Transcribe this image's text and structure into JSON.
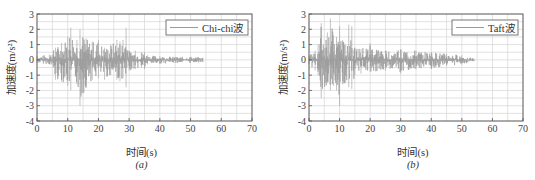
{
  "chart_data": [
    {
      "type": "line",
      "panel": "a",
      "caption": "(a)",
      "title": "",
      "xlabel": "时间(s)",
      "ylabel": "加速度(m/s²)",
      "xlim": [
        0,
        70
      ],
      "ylim": [
        -4,
        3
      ],
      "xticks": [
        0,
        10,
        20,
        30,
        40,
        50,
        60,
        70
      ],
      "yticks": [
        3,
        2,
        1,
        0,
        -1,
        -2,
        -3,
        -4
      ],
      "grid": true,
      "legend": {
        "position": "upper right",
        "entries": [
          "Chi-chi波"
        ]
      },
      "series": [
        {
          "name": "Chi-chi波",
          "color": "#9a9a9a",
          "duration_s": 54,
          "envelope": {
            "t": [
              0,
              4,
              6,
              8,
              10,
              11,
              13,
              14,
              16,
              18,
              20,
              22,
              24,
              26,
              27,
              28,
              29,
              30,
              32,
              34,
              35,
              36,
              40,
              45,
              50,
              54
            ],
            "upper": [
              0.25,
              0.35,
              0.8,
              1.1,
              1.5,
              2.1,
              1.3,
              2.0,
              1.4,
              1.2,
              1.3,
              0.8,
              1.0,
              1.3,
              1.2,
              1.3,
              2.1,
              0.6,
              0.6,
              0.5,
              0.5,
              0.3,
              0.25,
              0.2,
              0.2,
              0.15
            ],
            "lower": [
              -0.2,
              -0.3,
              -1.3,
              -1.4,
              -1.7,
              -2.0,
              -1.6,
              -3.0,
              -1.8,
              -1.3,
              -1.2,
              -1.3,
              -1.0,
              -1.3,
              -1.4,
              -1.2,
              -1.8,
              -0.7,
              -0.6,
              -0.5,
              -0.6,
              -0.3,
              -0.25,
              -0.2,
              -0.2,
              -0.15
            ]
          },
          "peak_max": 2.1,
          "peak_min": -3.0
        }
      ]
    },
    {
      "type": "line",
      "panel": "b",
      "caption": "(b)",
      "title": "",
      "xlabel": "时间(s)",
      "ylabel": "加速度(m/s²)",
      "xlim": [
        0,
        70
      ],
      "ylim": [
        -4,
        3
      ],
      "xticks": [
        0,
        10,
        20,
        30,
        40,
        50,
        60,
        70
      ],
      "yticks": [
        3,
        2,
        1,
        0,
        -1,
        -2,
        -3,
        -4
      ],
      "grid": true,
      "legend": {
        "position": "upper right",
        "entries": [
          "Taft波"
        ]
      },
      "series": [
        {
          "name": "Taft波",
          "color": "#9a9a9a",
          "duration_s": 54,
          "envelope": {
            "t": [
              0,
              2,
              3,
              4,
              6,
              7,
              8,
              9,
              10,
              11,
              12,
              13,
              14,
              15,
              17,
              20,
              25,
              30,
              35,
              40,
              45,
              50,
              54
            ],
            "upper": [
              0.3,
              0.6,
              1.0,
              2.4,
              1.8,
              2.7,
              1.6,
              1.5,
              2.2,
              1.3,
              1.0,
              2.3,
              2.2,
              0.8,
              0.7,
              1.1,
              0.6,
              0.7,
              0.6,
              0.5,
              0.4,
              0.3,
              0.1
            ],
            "lower": [
              -0.3,
              -0.7,
              -1.0,
              -2.5,
              -1.5,
              -2.0,
              -1.7,
              -2.0,
              -3.0,
              -1.6,
              -1.5,
              -1.8,
              -1.9,
              -1.0,
              -0.9,
              -0.8,
              -0.7,
              -0.9,
              -0.6,
              -0.6,
              -0.4,
              -0.3,
              -0.1
            ]
          },
          "peak_max": 2.7,
          "peak_min": -3.0
        }
      ]
    }
  ]
}
